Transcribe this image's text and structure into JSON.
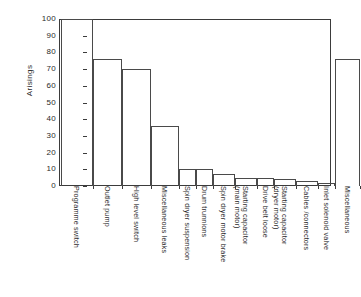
{
  "chart_data": {
    "type": "bar",
    "title": "",
    "xlabel": "",
    "ylabel": "Arisings",
    "ylim": [
      0,
      100
    ],
    "yticks": [
      0,
      10,
      20,
      30,
      40,
      50,
      60,
      70,
      80,
      90,
      100
    ],
    "grid": false,
    "legend": false,
    "categories": [
      "Programme switch",
      "Outlet pump",
      "High level switch",
      "Miscellaneous leaks",
      "Spin dryer suspension",
      "Drum trunnions",
      "Spin dryer motor brake",
      "Starting capacitor\n(main motor)",
      "Drive belt loose",
      "Starting capacitor\n(dryer motor)",
      "Cables /connectors",
      "Inlet solenoid valve",
      "Miscellaneous"
    ],
    "values": [
      100,
      76,
      70,
      36,
      10,
      10,
      7,
      5,
      5,
      4,
      3,
      2,
      76
    ],
    "series": [
      {
        "name": "Arisings",
        "values": [
          100,
          76,
          70,
          36,
          10,
          10,
          7,
          5,
          5,
          4,
          3,
          2,
          76
        ]
      }
    ]
  },
  "axis": {
    "y_title": "Arisings",
    "y_tick_labels": [
      "100",
      "90",
      "80",
      "70",
      "60",
      "50",
      "40",
      "30",
      "20",
      "10",
      "0"
    ]
  },
  "colors": {
    "bar_outline": "#4a4a4a",
    "axis": "#3b3b3b",
    "text": "#2b2b2b",
    "background": "#ffffff"
  }
}
